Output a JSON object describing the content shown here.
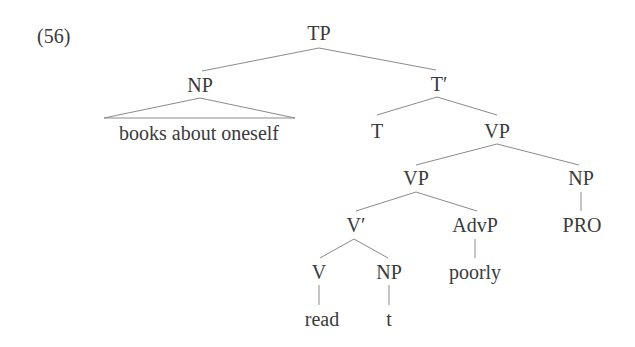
{
  "example": {
    "number": "(56)"
  },
  "tree": {
    "nodes": {
      "tp": "TP",
      "np_subject": "NP",
      "np_subject_content": "books about oneself",
      "t_bar": "T′",
      "t": "T",
      "vp_upper": "VP",
      "vp_lower": "VP",
      "np_right": "NP",
      "pro": "PRO",
      "v_bar": "V′",
      "advp": "AdvP",
      "poorly": "poorly",
      "v": "V",
      "np_object": "NP",
      "read": "read",
      "trace": "t"
    },
    "structure": {
      "TP": [
        "NP",
        "T′"
      ],
      "NP": [
        "books about oneself (triangle)"
      ],
      "T′": [
        "T",
        "VP"
      ],
      "VP": [
        "VP",
        "NP"
      ],
      "VP (lower)": [
        "V′",
        "AdvP"
      ],
      "NP (right)": [
        "PRO"
      ],
      "V′": [
        "V",
        "NP"
      ],
      "AdvP": [
        "poorly"
      ],
      "V": [
        "read"
      ],
      "NP (object)": [
        "t"
      ]
    }
  },
  "colors": {
    "text": "#3a3a3a",
    "lines": "#8a8a8a",
    "background": "#ffffff"
  }
}
